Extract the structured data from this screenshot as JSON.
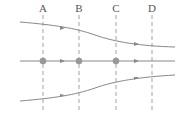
{
  "diagram": {
    "type": "streamlines",
    "sections": [
      {
        "label": "A",
        "x": 43
      },
      {
        "label": "B",
        "x": 79
      },
      {
        "label": "C",
        "x": 116
      },
      {
        "label": "D",
        "x": 152
      }
    ],
    "streamlines": [
      {
        "name": "top",
        "description": "curves downward from left to right (converging)"
      },
      {
        "name": "center",
        "description": "straight horizontal line with particles at A, B, C"
      },
      {
        "name": "bottom",
        "description": "curves upward from left to right (converging)"
      }
    ],
    "particles_at": [
      "A",
      "B",
      "C"
    ],
    "colors": {
      "line": "#888888",
      "dashed": "#999999",
      "particle": "#999999",
      "label": "#555555"
    }
  }
}
